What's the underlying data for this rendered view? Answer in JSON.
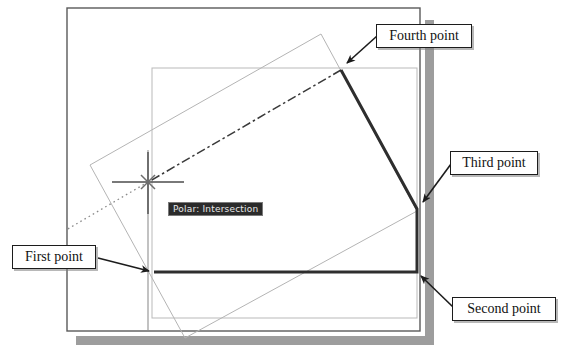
{
  "figure": {
    "canvas": {
      "width": 564,
      "height": 362
    },
    "background_color": "#ffffff"
  },
  "drawing_page": {
    "name": "drawing-sheet",
    "border_color": "#5a5a5a",
    "fill_color": "#ffffff",
    "shadow_color": "#9d9d9d",
    "rect": {
      "x": 67,
      "y": 8,
      "width": 353,
      "height": 323
    }
  },
  "limits_rectangle": {
    "name": "limits-rectangle",
    "stroke_color": "#b9b9b9",
    "rect": {
      "x": 152,
      "y": 68,
      "width": 265,
      "height": 250
    }
  },
  "rotated_rectangle": {
    "name": "rotated-rectangle",
    "stroke_color": "#b4b4b4",
    "points": "321,34 417,211 185,338 90,165"
  },
  "polyline": {
    "name": "drawn-polyline",
    "stroke_color": "#2e2e2e",
    "stroke_width": 3,
    "vertices": [
      {
        "label": "First point",
        "x": 154,
        "y": 272
      },
      {
        "label": "Second point",
        "x": 417,
        "y": 272
      },
      {
        "label": "Third point",
        "x": 417,
        "y": 209
      },
      {
        "label": "Fourth point",
        "x": 341,
        "y": 70
      }
    ]
  },
  "rubber_band": {
    "name": "rubber-band-line",
    "style": "dash-dot",
    "stroke_color": "#3a3a3a",
    "from": {
      "x": 341,
      "y": 70
    },
    "to": {
      "x": 148,
      "y": 182
    }
  },
  "polar_tracking_line": {
    "name": "polar-tracking-line",
    "style": "dotted",
    "stroke_color": "#808080",
    "from": {
      "x": 148,
      "y": 182
    },
    "to": {
      "x": 68,
      "y": 229
    }
  },
  "crosshair": {
    "name": "crosshair-cursor",
    "center": {
      "x": 148,
      "y": 182
    },
    "arm_length": 36,
    "stroke_color": "#4c4c4c",
    "vertical_top": 150,
    "vertical_bottom": 330
  },
  "snap_marker": {
    "name": "intersection-snap-marker",
    "shape": "x-cross",
    "center": {
      "x": 148,
      "y": 182
    },
    "size": 13,
    "stroke_color": "#6e6e6e"
  },
  "tooltip": {
    "name": "snap-tooltip",
    "text": "Polar: Intersection",
    "background_color": "#2b2b2b",
    "text_color": "#e8e8e8",
    "border_color": "#7a7a7a"
  },
  "callouts": [
    {
      "id": "fourth",
      "name": "callout-fourth-point",
      "label": "Fourth point",
      "leader_from": {
        "x": 376,
        "y": 36
      },
      "leader_to": {
        "x": 345,
        "y": 64
      }
    },
    {
      "id": "third",
      "name": "callout-third-point",
      "label": "Third point",
      "leader_from": {
        "x": 450,
        "y": 163
      },
      "leader_to": {
        "x": 421,
        "y": 203
      }
    },
    {
      "id": "first",
      "name": "callout-first-point",
      "label": "First point",
      "leader_from": {
        "x": 97,
        "y": 257
      },
      "leader_to": {
        "x": 150,
        "y": 270
      }
    },
    {
      "id": "second",
      "name": "callout-second-point",
      "label": "Second point",
      "leader_from": {
        "x": 452,
        "y": 308
      },
      "leader_to": {
        "x": 421,
        "y": 277
      }
    }
  ]
}
